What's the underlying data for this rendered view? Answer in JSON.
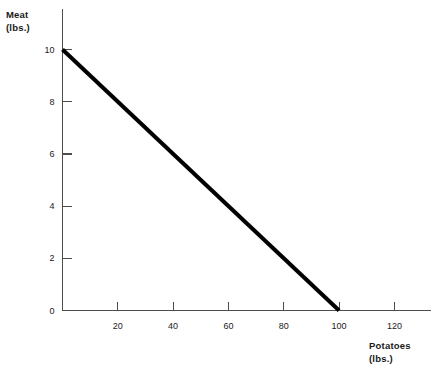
{
  "chart_data": {
    "type": "line",
    "title": "",
    "xlabel": "Potatoes",
    "xlabel_unit": "(lbs.)",
    "ylabel": "Meat",
    "ylabel_unit": "(lbs.)",
    "xlim": [
      0,
      132
    ],
    "ylim": [
      0,
      10.8
    ],
    "xticks": [
      20,
      40,
      60,
      80,
      100,
      120
    ],
    "xticklabels": [
      "20",
      "40",
      "60",
      "80",
      "100",
      "120"
    ],
    "yticks": [
      0,
      2,
      4,
      6,
      8,
      10
    ],
    "yticklabels": [
      "0",
      "2",
      "4",
      "6",
      "8",
      "10"
    ],
    "grid": false,
    "legend": false,
    "series": [
      {
        "name": "budget-constraint",
        "color": "#000000",
        "linewidth": 4,
        "x": [
          0,
          100
        ],
        "y": [
          10,
          0
        ]
      }
    ],
    "annotations": []
  },
  "axis": {
    "x_title": "Potatoes",
    "x_unit": "(lbs.)",
    "y_title": "Meat",
    "y_unit": "(lbs.)"
  },
  "colors": {
    "line": "#000000",
    "axis": "#4d4d4d",
    "text": "#1a1a1a",
    "background": "#ffffff"
  }
}
